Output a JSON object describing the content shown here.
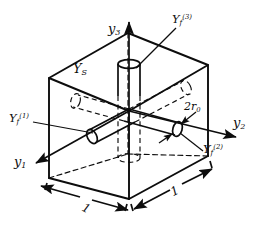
{
  "figure": {
    "type": "technical-line-drawing",
    "background_color": "#ffffff",
    "line_color": "#0d0d0d"
  },
  "axes": [
    {
      "id": "y1",
      "label_main": "y",
      "label_sub": "1",
      "direction": "down-left"
    },
    {
      "id": "y2",
      "label_main": "y",
      "label_sub": "2",
      "direction": "right"
    },
    {
      "id": "y3",
      "label_main": "y",
      "label_sub": "3",
      "direction": "up"
    }
  ],
  "labels": {
    "axis_y1": {
      "main": "y",
      "sub": "1"
    },
    "axis_y2": {
      "main": "y",
      "sub": "2"
    },
    "axis_y3": {
      "main": "y",
      "sub": "3"
    },
    "matrix": {
      "main": "Y",
      "sub": "S"
    },
    "fiber1": {
      "main": "Y",
      "sub": "f",
      "sup": "(1)"
    },
    "fiber2": {
      "main": "Y",
      "sub": "f",
      "sup": "(2)"
    },
    "fiber3": {
      "main": "Y",
      "sub": "f",
      "sup": "(3)"
    },
    "diameter": {
      "main": "2r",
      "sub": "0"
    },
    "dimension_left": "1",
    "dimension_right": "1"
  },
  "cube": {
    "vertices_px": {
      "top_back": [
        128,
        33
      ],
      "top_left": [
        49,
        78
      ],
      "top_right": [
        208,
        65
      ],
      "top_front": [
        129,
        111
      ],
      "bottom_left": [
        49,
        178
      ],
      "bottom_right": [
        208,
        156
      ],
      "bottom_front": [
        129,
        199
      ]
    },
    "edge_style_visible": "solid",
    "edge_style_hidden": "dashed"
  },
  "fibers": [
    {
      "axis": "y1",
      "label": "Y_f^(1)",
      "protrudes": "left-front-face",
      "style": "solid outside, dashed inside"
    },
    {
      "axis": "y2",
      "label": "Y_f^(2)",
      "protrudes": "right-front-face",
      "style": "solid outside, dashed inside"
    },
    {
      "axis": "y3",
      "label": "Y_f^(3)",
      "protrudes": "top-face",
      "style": "solid outside, dashed inside"
    }
  ],
  "dimensions": [
    {
      "id": "left-edge",
      "value": "1",
      "arrow": "double"
    },
    {
      "id": "right-edge",
      "value": "1",
      "arrow": "double"
    },
    {
      "id": "fiber-diameter",
      "value": "2r0",
      "arrow": "double"
    }
  ]
}
